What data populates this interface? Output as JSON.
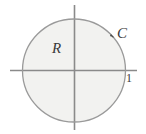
{
  "figure": {
    "type": "math-diagram",
    "background_color": "#ffffff",
    "axes": {
      "axis_color": "#8a8a8a",
      "x_axis": {
        "name": "x-axis",
        "x1": 10,
        "y1": 70.5,
        "x2": 137,
        "y2": 70.5
      },
      "y_axis": {
        "name": "y-axis",
        "x1": 74.5,
        "y1": 5,
        "x2": 74.5,
        "y2": 130
      }
    },
    "circle": {
      "name": "circle-C",
      "cx": 74,
      "cy": 70.5,
      "r": 51.5,
      "stroke_color": "#9a9a9a",
      "fill_color": "#f2f2f0",
      "orientation": "counterclockwise"
    },
    "orientation_arrow": {
      "name": "counterclockwise-arrow",
      "tip_x": 104,
      "tip_y": 29,
      "color": "#4a4a4a"
    },
    "labels": {
      "region": {
        "text": "R",
        "x": 52,
        "y": 53
      },
      "curve": {
        "text": "C",
        "x": 117,
        "y": 38
      },
      "unit": {
        "text": "1",
        "x": 126,
        "y": 82
      }
    }
  }
}
